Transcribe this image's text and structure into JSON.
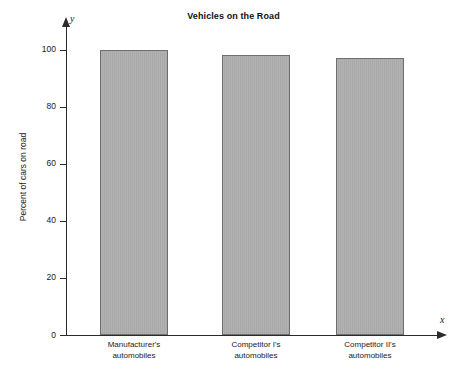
{
  "chart_data": {
    "type": "bar",
    "title": "Vehicles on the Road",
    "xlabel": "",
    "ylabel": "Percent of cars on road",
    "x_axis_variable": "x",
    "y_axis_variable": "y",
    "categories": [
      "Manufacturer's automobiles",
      "Competitor I's automobiles",
      "Competitor II's automobiles"
    ],
    "category_lines": [
      [
        "Manufacturer's",
        "automobiles"
      ],
      [
        "Competitor I's",
        "automobiles"
      ],
      [
        "Competitor II's",
        "automobiles"
      ]
    ],
    "values": [
      100,
      98,
      97
    ],
    "ylim": [
      0,
      100
    ],
    "yticks": [
      0,
      20,
      40,
      60,
      80,
      100
    ],
    "ytick_labels": [
      "0",
      "20",
      "40",
      "60",
      "80",
      "100"
    ],
    "grid": false,
    "legend": false,
    "bar_fill_color": "#a9a9a9",
    "bar_border_color": "#6e6e6e",
    "axis_color": "#2b2b2b"
  }
}
